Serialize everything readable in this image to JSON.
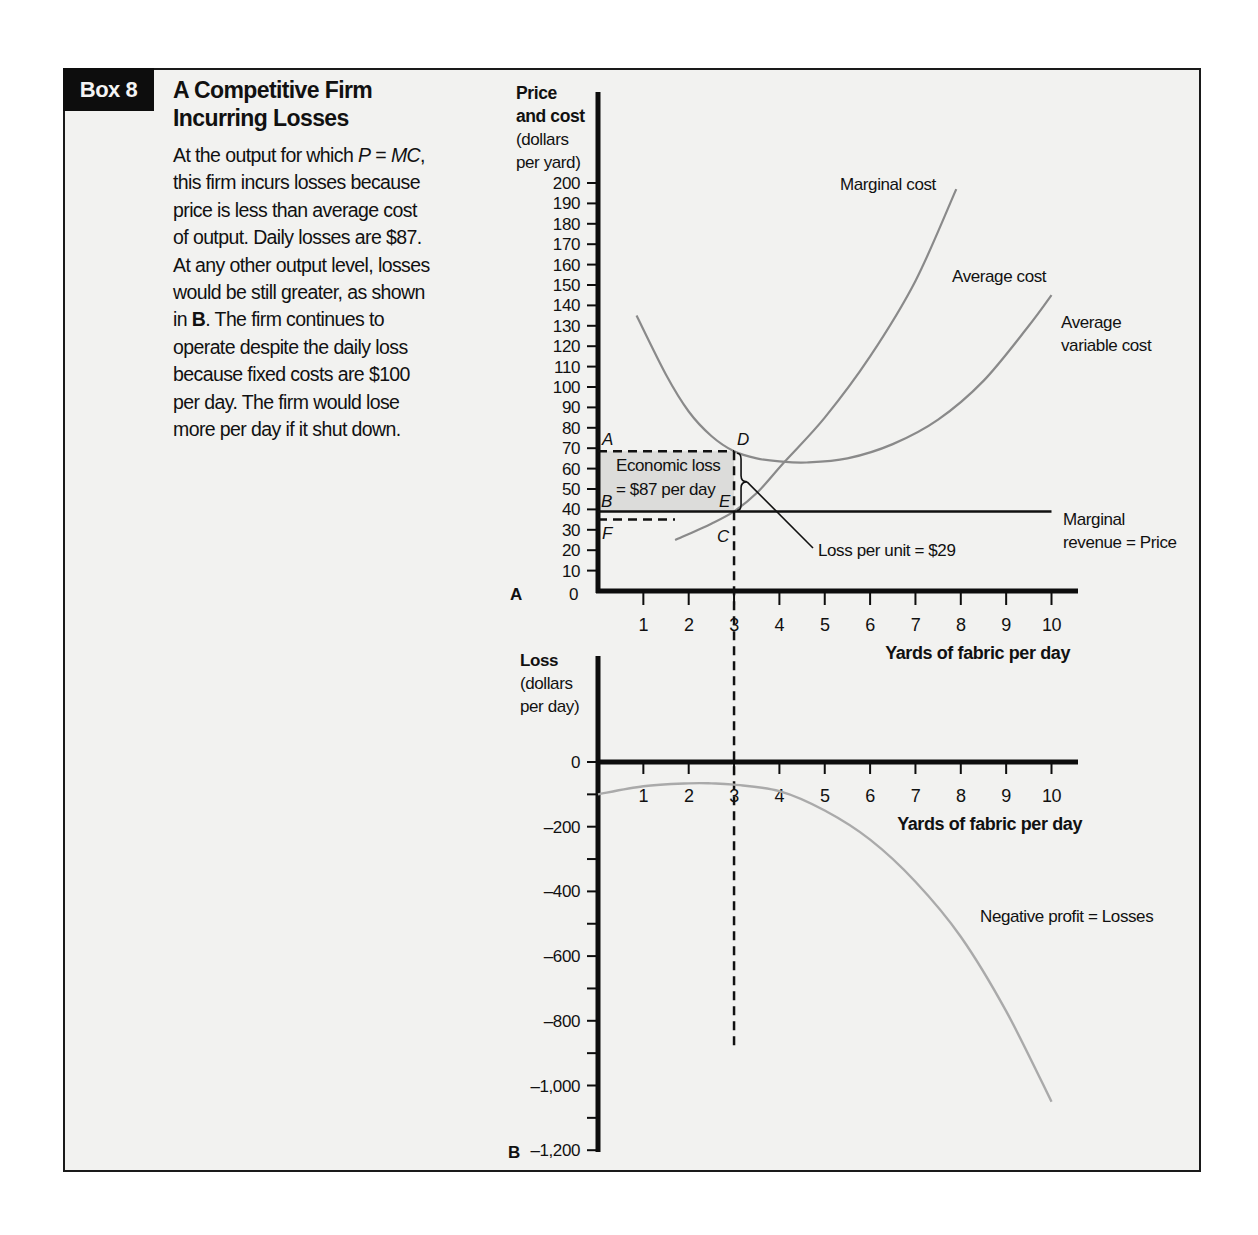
{
  "box": {
    "tag": "Box 8",
    "title_line1": "A Competitive Firm",
    "title_line2": "Incurring Losses",
    "description_lines": [
      "At the output for which P = MC,",
      "this firm incurs losses because",
      "price is less than average cost",
      "of output. Daily losses are $87.",
      "At any other output level, losses",
      "would be still greater, as shown",
      "in B. The firm continues to",
      "operate despite the daily loss",
      "because fixed costs are $100",
      "per day. The firm would lose",
      "more per day if it shut down."
    ]
  },
  "colors": {
    "background": "#f2f2f0",
    "axis": "#0d0d0d",
    "curve": "#8a8a8a",
    "loss_shading": "#dcdcda",
    "tag_bg": "#0d0d0d"
  },
  "chart_data": [
    {
      "panel": "A",
      "type": "line",
      "ylabel_lines": [
        "Price",
        "and cost",
        "(dollars",
        "per yard)"
      ],
      "xlabel": "Yards of fabric per day",
      "x_ticks": [
        1,
        2,
        3,
        4,
        5,
        6,
        7,
        8,
        9,
        10
      ],
      "y_ticks": [
        0,
        10,
        20,
        30,
        40,
        50,
        60,
        70,
        80,
        90,
        100,
        110,
        120,
        130,
        140,
        150,
        160,
        170,
        180,
        190,
        200
      ],
      "xlim": [
        0,
        10.6
      ],
      "ylim": [
        0,
        200
      ],
      "grid": false,
      "series": [
        {
          "name": "Marginal cost",
          "x": [
            1.7,
            2.5,
            3.0,
            3.5,
            4.1,
            5.0,
            6.0,
            7.0,
            7.9
          ],
          "y": [
            25,
            33,
            39,
            48,
            63,
            85,
            115,
            152,
            197
          ]
        },
        {
          "name": "Average cost",
          "x": [
            0.85,
            1.5,
            2.0,
            2.5,
            3.0,
            3.5,
            4.0,
            4.6,
            5.5,
            6.5,
            7.5,
            8.5,
            9.5,
            10.0
          ],
          "y": [
            135,
            106,
            88,
            76,
            68.5,
            65,
            63.5,
            63,
            65,
            72,
            84,
            103,
            130,
            145
          ]
        },
        {
          "name": "Marginal revenue = Price",
          "x": [
            0,
            10
          ],
          "y": [
            39,
            39
          ]
        }
      ],
      "labels": {
        "marginal_cost": "Marginal cost",
        "average_cost": "Average cost",
        "avc_line1": "Average",
        "avc_line2": "variable cost",
        "mr_line1": "Marginal",
        "mr_line2": "revenue  = Price",
        "loss_line1": "Economic loss",
        "loss_line2": "= $87 per day",
        "loss_per_unit": "Loss per unit  = $29",
        "point_A": "A",
        "point_B": "B",
        "point_C": "C",
        "point_D": "D",
        "point_E": "E",
        "point_F": "F",
        "panel_letter": "A"
      },
      "annotations": {
        "output_q": 3,
        "average_cost_at_q": 68.5,
        "price": 39,
        "avc_level_F": 35,
        "loss_per_unit": 29,
        "total_loss": 87
      }
    },
    {
      "panel": "B",
      "type": "line",
      "ylabel_lines": [
        "Loss",
        "(dollars",
        "per day)"
      ],
      "xlabel": "Yards of fabric per day",
      "x_ticks": [
        1,
        2,
        3,
        4,
        5,
        6,
        7,
        8,
        9,
        10
      ],
      "y_ticks": [
        0,
        -200,
        -400,
        -600,
        -800,
        -1000,
        -1200
      ],
      "y_tick_labels": [
        "0",
        "–200",
        "–400",
        "–600",
        "–800",
        "–1,000",
        "–1,200"
      ],
      "xlim": [
        0,
        10.6
      ],
      "ylim": [
        -1200,
        200
      ],
      "grid": false,
      "series": [
        {
          "name": "Negative profit = Losses",
          "x": [
            0,
            1,
            2,
            2.5,
            3,
            4,
            5,
            6,
            7,
            8,
            9,
            10
          ],
          "y": [
            -100,
            -75,
            -66,
            -66,
            -70,
            -90,
            -150,
            -240,
            -370,
            -540,
            -770,
            -1050
          ]
        }
      ],
      "labels": {
        "curve": "Negative profit  = Losses",
        "panel_letter": "B"
      }
    }
  ]
}
